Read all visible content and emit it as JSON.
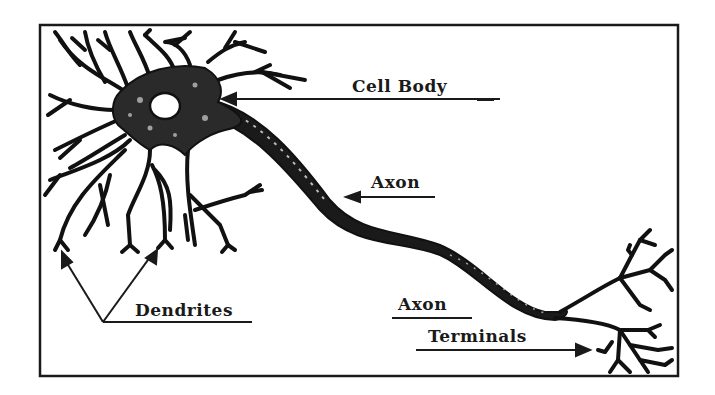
{
  "diagram": {
    "colors": {
      "ink": "#1a1a1a",
      "background": "#ffffff"
    },
    "labels": {
      "cell_body": "Cell Body",
      "axon": "Axon",
      "axon_terminals_line1": "Axon",
      "axon_terminals_line2": "Terminals",
      "dendrites": "Dendrites"
    },
    "parts": [
      "dendrites",
      "cell-body",
      "nucleus",
      "axon",
      "axon-terminals"
    ]
  }
}
